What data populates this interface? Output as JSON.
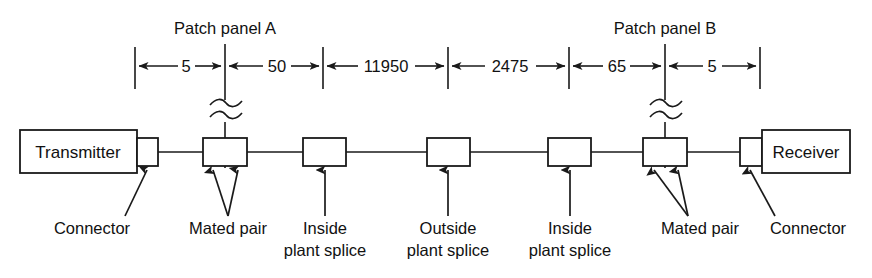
{
  "diagram": {
    "title_notes": [
      "Patch panel A",
      "Patch panel B"
    ],
    "panels": [
      {
        "name": "patch-panel-a",
        "label": "Patch panel A",
        "x": 225
      },
      {
        "name": "patch-panel-b",
        "label": "Patch panel B",
        "x": 665
      }
    ],
    "endpoints": {
      "transmitter": "Transmitter",
      "receiver": "Receiver"
    },
    "dimensions": [
      {
        "label": "5",
        "from": 135,
        "to": 225
      },
      {
        "label": "50",
        "from": 225,
        "to": 323
      },
      {
        "label": "11950",
        "from": 323,
        "to": 448
      },
      {
        "label": "2475",
        "from": 448,
        "to": 569
      },
      {
        "label": "65",
        "from": 569,
        "to": 665
      },
      {
        "label": "5",
        "from": 665,
        "to": 760
      }
    ],
    "callouts": [
      {
        "name": "connector-left",
        "text": "Connector",
        "text2": "",
        "cx": 92,
        "ty": 232
      },
      {
        "name": "mated-pair-left",
        "text": "Mated pair",
        "text2": "",
        "cx": 228,
        "ty": 232
      },
      {
        "name": "inside-plant-splice-left",
        "text": "Inside",
        "text2": "plant splice",
        "cx": 325,
        "ty": 232
      },
      {
        "name": "outside-plant-splice",
        "text": "Outside",
        "text2": "plant splice",
        "cx": 448,
        "ty": 232
      },
      {
        "name": "inside-plant-splice-right",
        "text": "Inside",
        "text2": "plant splice",
        "cx": 570,
        "ty": 232
      },
      {
        "name": "mated-pair-right",
        "text": "Mated pair",
        "text2": "",
        "cx": 700,
        "ty": 232
      },
      {
        "name": "connector-right",
        "text": "Connector",
        "text2": "",
        "cx": 808,
        "ty": 232
      }
    ],
    "components": [
      {
        "name": "transmitter-box",
        "label": "Transmitter",
        "x": 20,
        "y": 130,
        "w": 117,
        "h": 43
      },
      {
        "name": "connector-box-left",
        "label": "",
        "x": 137,
        "y": 138,
        "w": 21,
        "h": 28
      },
      {
        "name": "mated-pair-box-left",
        "label": "",
        "x": 203,
        "y": 138,
        "w": 44,
        "h": 28
      },
      {
        "name": "inside-plant-splice-box-left",
        "label": "",
        "x": 303,
        "y": 138,
        "w": 43,
        "h": 28
      },
      {
        "name": "outside-plant-splice-box",
        "label": "",
        "x": 427,
        "y": 138,
        "w": 43,
        "h": 28
      },
      {
        "name": "inside-plant-splice-box-right",
        "label": "",
        "x": 548,
        "y": 138,
        "w": 43,
        "h": 28
      },
      {
        "name": "mated-pair-box-right",
        "label": "",
        "x": 643,
        "y": 138,
        "w": 44,
        "h": 28
      },
      {
        "name": "connector-box-right",
        "label": "",
        "x": 740,
        "y": 138,
        "w": 22,
        "h": 28
      },
      {
        "name": "receiver-box",
        "label": "Receiver",
        "x": 762,
        "y": 130,
        "w": 88,
        "h": 43
      }
    ],
    "colors": {
      "ink": "#1a1a1a",
      "paper": "#ffffff"
    }
  }
}
